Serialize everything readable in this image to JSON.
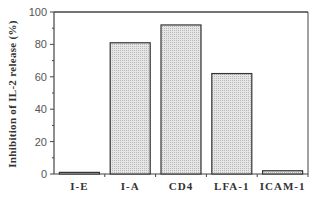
{
  "chart_data": {
    "type": "bar",
    "title": "",
    "xlabel": "",
    "ylabel": "Inhibition of IL-2 release (%)",
    "categories": [
      "I-E",
      "I-A",
      "CD4",
      "LFA-1",
      "ICAM-1"
    ],
    "values": [
      1,
      81,
      92,
      62,
      2
    ],
    "ylim": [
      0,
      100
    ],
    "yticks": [
      0,
      20,
      40,
      60,
      80,
      100
    ],
    "grid": false,
    "legend": null,
    "bar_fill": "#d9d9d9",
    "bar_edge": "#333333"
  }
}
